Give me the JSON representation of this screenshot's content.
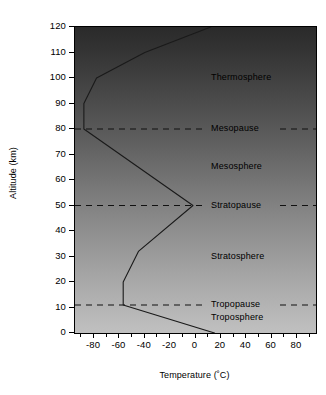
{
  "chart_data": {
    "type": "line",
    "title": "",
    "xlabel": "Temperature (˚C)",
    "ylabel": "Altitude (km)",
    "xlim": [
      -95,
      95
    ],
    "ylim": [
      0,
      120
    ],
    "grid": false,
    "legend_position": "none",
    "x_ticks": [
      -80,
      -60,
      -40,
      -20,
      0,
      20,
      40,
      60,
      80
    ],
    "x_tick_labels": [
      "-80",
      "-60",
      "-40",
      "-20",
      "0",
      "20",
      "40",
      "60",
      "80"
    ],
    "x_minor_tick_step": 10,
    "y_ticks": [
      0,
      10,
      20,
      30,
      40,
      50,
      60,
      70,
      80,
      90,
      100,
      110,
      120
    ],
    "y_tick_labels": [
      "0",
      "10",
      "20",
      "30",
      "40",
      "50",
      "60",
      "70",
      "80",
      "90",
      "100",
      "110",
      "120"
    ],
    "series": [
      {
        "name": "Standard atmosphere temperature profile",
        "orientation": "temperature-vs-altitude",
        "points": [
          {
            "temperature": 15,
            "altitude": 0
          },
          {
            "temperature": -57,
            "altitude": 11
          },
          {
            "temperature": -57,
            "altitude": 20
          },
          {
            "temperature": -45,
            "altitude": 32
          },
          {
            "temperature": -2,
            "altitude": 50
          },
          {
            "temperature": -88,
            "altitude": 80
          },
          {
            "temperature": -88,
            "altitude": 90
          },
          {
            "temperature": -78,
            "altitude": 100
          },
          {
            "temperature": -40,
            "altitude": 110
          },
          {
            "temperature": 12,
            "altitude": 120
          }
        ]
      }
    ],
    "boundaries": [
      {
        "name": "Mesopause",
        "altitude": 80
      },
      {
        "name": "Stratopause",
        "altitude": 50
      },
      {
        "name": "Tropopause",
        "altitude": 11
      }
    ],
    "layers": [
      {
        "name": "Thermosphere",
        "label_altitude": 100
      },
      {
        "name": "Mesosphere",
        "label_altitude": 65
      },
      {
        "name": "Stratosphere",
        "label_altitude": 30
      },
      {
        "name": "Troposphere",
        "label_altitude": 6
      }
    ],
    "annotations": [
      {
        "text": "Thermosphere",
        "altitude": 100
      },
      {
        "text": "Mesopause",
        "altitude": 80
      },
      {
        "text": "Mesosphere",
        "altitude": 65
      },
      {
        "text": "Stratopause",
        "altitude": 50
      },
      {
        "text": "Stratosphere",
        "altitude": 30
      },
      {
        "text": "Tropopause",
        "altitude": 11
      },
      {
        "text": "Troposphere",
        "altitude": 6
      }
    ],
    "style": {
      "background_top_color": "#2a2a2a",
      "background_bottom_color": "#c0c0c0",
      "line_color": "#1a1a1a",
      "dashed_line_color": "#111111",
      "frame_color": "#000000"
    }
  }
}
